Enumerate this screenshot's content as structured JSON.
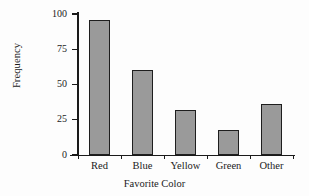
{
  "chart_data": {
    "type": "bar",
    "title": "",
    "xlabel": "Favorite Color",
    "ylabel": "Frequency",
    "categories": [
      "Red",
      "Blue",
      "Yellow",
      "Green",
      "Other"
    ],
    "values": [
      96,
      60,
      32,
      18,
      36
    ],
    "ylim": [
      0,
      100
    ],
    "yticks": [
      0,
      25,
      50,
      75,
      100
    ],
    "ytick_labels": [
      "0",
      "25",
      "50",
      "75",
      "100"
    ],
    "grid": false,
    "legend": null,
    "bar_fill_color": "#9a9a9a",
    "bar_edge_color": "#1e1e1e",
    "axis_color": "#1a1a1a",
    "background_color": "#fdfdfd"
  }
}
